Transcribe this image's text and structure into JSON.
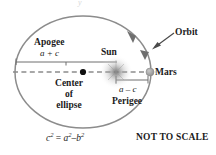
{
  "diagram": {
    "title_ghost": "y",
    "caption": "NOT TO SCALE",
    "formula": {
      "lhs_base": "c",
      "lhs_exp": "2",
      "eq": "=",
      "rhs1_base": "a",
      "rhs1_exp": "2",
      "minus": "–",
      "rhs2_base": "b",
      "rhs2_exp": "2",
      "plain": "c2 = a2 – b2"
    },
    "labels": {
      "apogee": "Apogee",
      "apogee_distance": "a + c",
      "sun": "Sun",
      "orbit": "Orbit",
      "mars": "Mars",
      "center_line1": "Center",
      "center_line2": "of",
      "center_line3": "ellipse",
      "perigee": "Perigee",
      "perigee_distance": "a – c"
    },
    "icons": {
      "sun": "sun-glow-icon",
      "mars": "mars-planet-icon",
      "center": "center-point-icon",
      "orbit_direction": "orbit-direction-arrow-icon",
      "orbit_pointer": "orbit-pointer-arrow-icon"
    },
    "colors": {
      "orbit_stroke": "#8c8c8c",
      "axis_dash": "#8c8c8c",
      "measure_line": "#6e6e6e",
      "text": "#1a1a1a",
      "sun_glow": "#9a9a9a",
      "mars_body": "#a8a8a8",
      "background": "#ffffff"
    },
    "geometry": {
      "ellipse_cx": 83,
      "ellipse_cy": 72,
      "ellipse_rx": 68,
      "ellipse_ry": 56,
      "center_point_x": 83,
      "center_point_y": 72,
      "sun_x": 116,
      "sun_y": 72,
      "mars_x": 150,
      "mars_y": 72,
      "apogee_x": 15,
      "perigee_x": 150
    }
  }
}
